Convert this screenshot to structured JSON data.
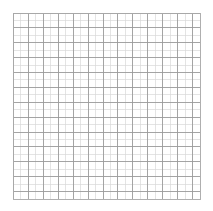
{
  "page": {
    "width": 213,
    "height": 211,
    "background_color": "#ffffff",
    "content_type": "grid-paper",
    "has_text": false,
    "has_labels": false
  },
  "grid": {
    "origin_x": 13.5,
    "origin_y": 13.0,
    "width": 186.5,
    "height": 186.0,
    "columns": 25,
    "rows": 25,
    "cell_width": 7.46,
    "cell_height": 7.44,
    "minor_line_color": "#d9d9d9",
    "minor_line_width": 0.7,
    "major_line_color": "#9a9a9a",
    "major_line_width": 0.9,
    "major_every": 2,
    "border_color": "#a8a8a8",
    "border_width": 0.9,
    "fill_color": "#ffffff"
  }
}
